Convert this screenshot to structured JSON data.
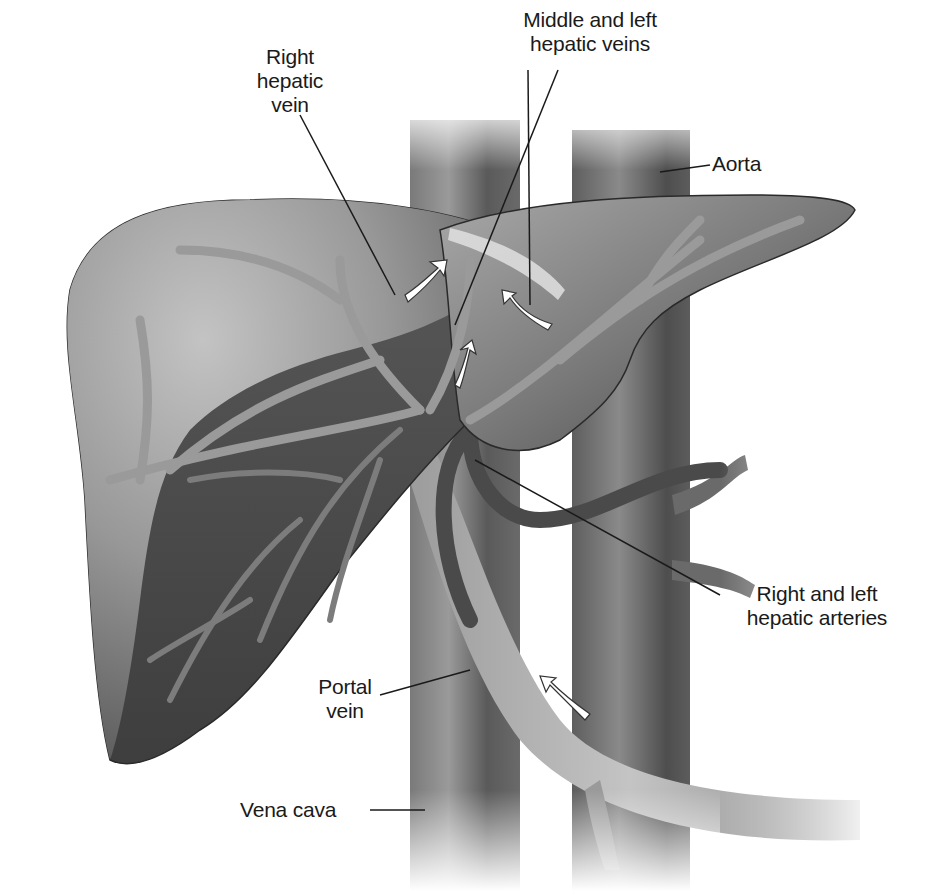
{
  "figure": {
    "colors": {
      "background": "#ffffff",
      "liver_light": "#b9b9b9",
      "liver_mid": "#8c8c8c",
      "liver_dark": "#4a4a4a",
      "vessel": "#6e6e6e",
      "vessel_dark": "#3c3c3c",
      "arrow_fill": "#ffffff",
      "leader_line": "#1a1a1a",
      "label_text": "#1a1a1a"
    },
    "labels": [
      {
        "id": "right-hepatic-vein",
        "text": "Right\nhepatic\nvein"
      },
      {
        "id": "middle-left-hepatic-veins",
        "text": "Middle and left\nhepatic veins"
      },
      {
        "id": "aorta",
        "text": "Aorta"
      },
      {
        "id": "right-left-hepatic-arteries",
        "text": "Right and left\nhepatic arteries"
      },
      {
        "id": "portal-vein",
        "text": "Portal\nvein"
      },
      {
        "id": "vena-cava",
        "text": "Vena cava"
      }
    ],
    "flow_arrows": [
      {
        "id": "right-hepatic-vein-arrow",
        "direction": "up-right"
      },
      {
        "id": "middle-hepatic-vein-arrow",
        "direction": "up"
      },
      {
        "id": "left-hepatic-vein-arrow",
        "direction": "up-left"
      },
      {
        "id": "portal-vein-arrow",
        "direction": "up-left"
      }
    ]
  }
}
